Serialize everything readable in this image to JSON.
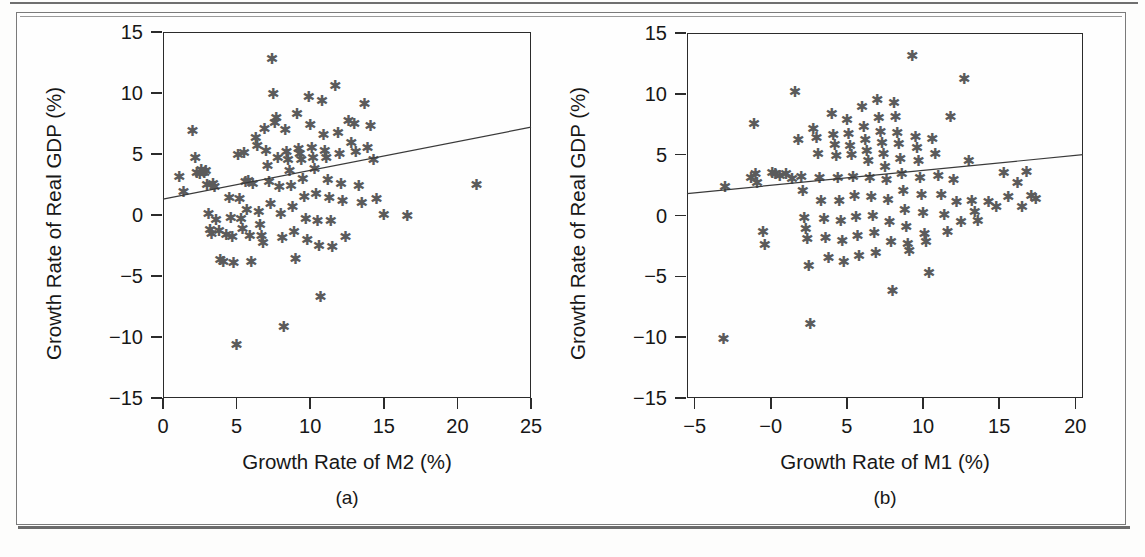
{
  "figure": {
    "panels": [
      {
        "id": "a",
        "caption": "(a)",
        "xlabel": "Growth Rate of M2 (%)",
        "ylabel": "Growth Rate of Real GDP (%)",
        "xticks": [
          "0",
          "5",
          "10",
          "15",
          "20",
          "25"
        ],
        "yticks": [
          "15",
          "10",
          "5",
          "0",
          "−5",
          "−10",
          "−15"
        ],
        "marker_glyph": "✱"
      },
      {
        "id": "b",
        "caption": "(b)",
        "xlabel": "Growth Rate of M1 (%)",
        "ylabel": "Growth Rate of Real GDP (%)",
        "xticks": [
          "−5",
          "−0",
          "5",
          "10",
          "15",
          "20"
        ],
        "yticks": [
          "15",
          "10",
          "5",
          "0",
          "−5",
          "−10",
          "−15"
        ],
        "marker_glyph": "✱"
      }
    ]
  },
  "chart_data": [
    {
      "type": "scatter",
      "id": "a",
      "title": "(a)",
      "xlabel": "Growth Rate of M2 (%)",
      "ylabel": "Growth Rate of Real GDP (%)",
      "xlim": [
        0,
        25
      ],
      "ylim": [
        -15,
        15
      ],
      "xticks": [
        0,
        5,
        10,
        15,
        20,
        25
      ],
      "yticks": [
        15,
        10,
        5,
        0,
        -5,
        -10,
        -15
      ],
      "grid": false,
      "legend": "none",
      "marker": "asterisk",
      "marker_color": "#5b5b5b",
      "trendline": {
        "x0": 0,
        "y0": 1.3,
        "x1": 25,
        "y1": 7.2,
        "color": "#3a3a3a"
      },
      "points": [
        [
          1.1,
          3.0
        ],
        [
          1.4,
          1.8
        ],
        [
          2.0,
          6.8
        ],
        [
          2.2,
          4.6
        ],
        [
          2.3,
          3.4
        ],
        [
          2.5,
          3.3
        ],
        [
          2.6,
          3.6
        ],
        [
          2.8,
          3.4
        ],
        [
          2.9,
          3.5
        ],
        [
          3.0,
          2.4
        ],
        [
          3.1,
          0.0
        ],
        [
          3.2,
          -1.3
        ],
        [
          3.3,
          -1.6
        ],
        [
          3.4,
          2.5
        ],
        [
          3.5,
          2.2
        ],
        [
          3.6,
          -0.5
        ],
        [
          3.8,
          -1.4
        ],
        [
          3.9,
          -3.8
        ],
        [
          4.1,
          -3.9
        ],
        [
          4.3,
          -1.7
        ],
        [
          4.5,
          1.3
        ],
        [
          4.6,
          -0.3
        ],
        [
          4.7,
          -1.9
        ],
        [
          4.8,
          -4.0
        ],
        [
          5.0,
          -10.7
        ],
        [
          5.1,
          4.8
        ],
        [
          5.2,
          1.2
        ],
        [
          5.3,
          -0.4
        ],
        [
          5.4,
          -1.2
        ],
        [
          5.5,
          5.0
        ],
        [
          5.6,
          2.6
        ],
        [
          5.7,
          0.3
        ],
        [
          5.8,
          2.7
        ],
        [
          5.9,
          -1.8
        ],
        [
          6.0,
          -3.9
        ],
        [
          6.1,
          2.5
        ],
        [
          6.3,
          6.2
        ],
        [
          6.4,
          5.6
        ],
        [
          6.5,
          0.2
        ],
        [
          6.6,
          -0.9
        ],
        [
          6.7,
          -1.8
        ],
        [
          6.8,
          -2.4
        ],
        [
          6.9,
          7.0
        ],
        [
          7.0,
          5.2
        ],
        [
          7.1,
          3.9
        ],
        [
          7.2,
          2.6
        ],
        [
          7.3,
          0.8
        ],
        [
          7.4,
          12.7
        ],
        [
          7.5,
          9.8
        ],
        [
          7.6,
          7.5
        ],
        [
          7.7,
          7.9
        ],
        [
          7.8,
          4.6
        ],
        [
          7.9,
          2.2
        ],
        [
          8.0,
          0.0
        ],
        [
          8.1,
          -2.0
        ],
        [
          8.2,
          -9.3
        ],
        [
          8.3,
          6.9
        ],
        [
          8.4,
          5.1
        ],
        [
          8.5,
          4.4
        ],
        [
          8.6,
          3.5
        ],
        [
          8.7,
          2.3
        ],
        [
          8.8,
          0.6
        ],
        [
          8.9,
          -1.5
        ],
        [
          9.0,
          -3.7
        ],
        [
          9.1,
          8.2
        ],
        [
          9.2,
          5.3
        ],
        [
          9.3,
          4.9
        ],
        [
          9.4,
          4.4
        ],
        [
          9.5,
          2.9
        ],
        [
          9.6,
          1.4
        ],
        [
          9.7,
          -0.4
        ],
        [
          9.8,
          -2.1
        ],
        [
          9.9,
          9.6
        ],
        [
          10.0,
          7.3
        ],
        [
          10.1,
          5.4
        ],
        [
          10.2,
          4.6
        ],
        [
          10.3,
          3.7
        ],
        [
          10.4,
          1.6
        ],
        [
          10.5,
          -0.6
        ],
        [
          10.6,
          -2.6
        ],
        [
          10.7,
          -6.8
        ],
        [
          10.8,
          9.3
        ],
        [
          10.9,
          6.5
        ],
        [
          11.0,
          5.2
        ],
        [
          11.1,
          4.6
        ],
        [
          11.2,
          2.8
        ],
        [
          11.3,
          1.3
        ],
        [
          11.4,
          -0.6
        ],
        [
          11.5,
          -2.7
        ],
        [
          11.7,
          10.5
        ],
        [
          11.9,
          6.6
        ],
        [
          12.0,
          4.9
        ],
        [
          12.1,
          2.5
        ],
        [
          12.2,
          1.1
        ],
        [
          12.4,
          -1.9
        ],
        [
          12.6,
          7.6
        ],
        [
          12.8,
          5.8
        ],
        [
          13.0,
          7.4
        ],
        [
          13.1,
          5.1
        ],
        [
          13.3,
          2.3
        ],
        [
          13.5,
          0.9
        ],
        [
          13.7,
          9.0
        ],
        [
          13.9,
          5.4
        ],
        [
          14.1,
          7.2
        ],
        [
          14.3,
          4.4
        ],
        [
          14.5,
          1.2
        ],
        [
          15.0,
          -0.1
        ],
        [
          16.6,
          -0.2
        ],
        [
          21.3,
          2.4
        ]
      ]
    },
    {
      "type": "scatter",
      "id": "b",
      "title": "(b)",
      "xlabel": "Growth Rate of M1 (%)",
      "ylabel": "Growth Rate of Real GDP (%)",
      "xlim": [
        -5.5,
        20.5
      ],
      "ylim": [
        -15,
        15
      ],
      "xticks": [
        -5,
        0,
        5,
        10,
        15,
        20
      ],
      "yticks": [
        15,
        10,
        5,
        0,
        -5,
        -10,
        -15
      ],
      "grid": false,
      "legend": "none",
      "marker": "asterisk",
      "marker_color": "#5b5b5b",
      "trendline": {
        "x0": -5.5,
        "y0": 1.8,
        "x1": 20.5,
        "y1": 5.0,
        "color": "#3a3a3a"
      },
      "points": [
        [
          -3.1,
          -10.2
        ],
        [
          -3.0,
          2.3
        ],
        [
          -1.3,
          3.0
        ],
        [
          -1.1,
          7.4
        ],
        [
          -1.0,
          3.3
        ],
        [
          -0.9,
          2.6
        ],
        [
          -0.5,
          -1.4
        ],
        [
          -0.4,
          -2.5
        ],
        [
          0.1,
          3.4
        ],
        [
          0.3,
          3.3
        ],
        [
          0.6,
          3.2
        ],
        [
          1.0,
          3.3
        ],
        [
          1.4,
          2.9
        ],
        [
          1.6,
          10.1
        ],
        [
          1.8,
          6.1
        ],
        [
          2.0,
          3.1
        ],
        [
          2.1,
          1.9
        ],
        [
          2.2,
          -0.3
        ],
        [
          2.3,
          -1.2
        ],
        [
          2.4,
          -2.0
        ],
        [
          2.5,
          -4.2
        ],
        [
          2.6,
          -9.0
        ],
        [
          2.8,
          7.0
        ],
        [
          3.0,
          6.3
        ],
        [
          3.1,
          5.0
        ],
        [
          3.2,
          3.0
        ],
        [
          3.3,
          1.1
        ],
        [
          3.5,
          -0.4
        ],
        [
          3.6,
          -1.9
        ],
        [
          3.8,
          -3.6
        ],
        [
          4.0,
          8.3
        ],
        [
          4.1,
          6.5
        ],
        [
          4.2,
          5.7
        ],
        [
          4.3,
          4.8
        ],
        [
          4.4,
          3.0
        ],
        [
          4.5,
          1.1
        ],
        [
          4.6,
          -0.5
        ],
        [
          4.7,
          -2.2
        ],
        [
          4.8,
          -3.9
        ],
        [
          5.0,
          7.8
        ],
        [
          5.1,
          6.6
        ],
        [
          5.2,
          5.6
        ],
        [
          5.3,
          4.9
        ],
        [
          5.4,
          3.1
        ],
        [
          5.5,
          1.5
        ],
        [
          5.6,
          -0.2
        ],
        [
          5.7,
          -1.8
        ],
        [
          5.8,
          -3.4
        ],
        [
          6.0,
          8.8
        ],
        [
          6.1,
          7.2
        ],
        [
          6.2,
          6.1
        ],
        [
          6.3,
          5.2
        ],
        [
          6.4,
          4.4
        ],
        [
          6.5,
          3.0
        ],
        [
          6.6,
          1.4
        ],
        [
          6.7,
          -0.1
        ],
        [
          6.8,
          -1.5
        ],
        [
          6.9,
          -3.2
        ],
        [
          7.0,
          9.4
        ],
        [
          7.1,
          7.9
        ],
        [
          7.2,
          6.8
        ],
        [
          7.3,
          5.9
        ],
        [
          7.4,
          5.0
        ],
        [
          7.5,
          3.9
        ],
        [
          7.6,
          2.8
        ],
        [
          7.7,
          1.2
        ],
        [
          7.8,
          -0.6
        ],
        [
          7.9,
          -2.3
        ],
        [
          8.0,
          -6.3
        ],
        [
          8.1,
          9.2
        ],
        [
          8.2,
          8.0
        ],
        [
          8.3,
          6.7
        ],
        [
          8.4,
          5.8
        ],
        [
          8.5,
          4.6
        ],
        [
          8.6,
          3.3
        ],
        [
          8.7,
          1.9
        ],
        [
          8.8,
          0.4
        ],
        [
          8.9,
          -1.0
        ],
        [
          9.0,
          -2.4
        ],
        [
          9.1,
          -3.0
        ],
        [
          9.3,
          13.0
        ],
        [
          9.5,
          6.4
        ],
        [
          9.6,
          5.5
        ],
        [
          9.7,
          4.4
        ],
        [
          9.8,
          3.0
        ],
        [
          9.9,
          1.6
        ],
        [
          10.0,
          0.1
        ],
        [
          10.1,
          -1.6
        ],
        [
          10.2,
          -2.3
        ],
        [
          10.4,
          -4.8
        ],
        [
          10.6,
          6.2
        ],
        [
          10.8,
          5.0
        ],
        [
          11.0,
          3.2
        ],
        [
          11.2,
          1.6
        ],
        [
          11.4,
          0.0
        ],
        [
          11.6,
          -1.4
        ],
        [
          11.8,
          8.0
        ],
        [
          12.0,
          2.8
        ],
        [
          12.2,
          1.0
        ],
        [
          12.5,
          -0.6
        ],
        [
          12.7,
          11.1
        ],
        [
          13.0,
          4.4
        ],
        [
          13.2,
          1.1
        ],
        [
          13.4,
          0.2
        ],
        [
          13.6,
          -0.5
        ],
        [
          14.3,
          1.0
        ],
        [
          14.8,
          0.6
        ],
        [
          15.3,
          3.4
        ],
        [
          15.6,
          1.4
        ],
        [
          16.2,
          2.6
        ],
        [
          16.5,
          0.6
        ],
        [
          16.8,
          3.5
        ],
        [
          17.1,
          1.5
        ],
        [
          17.4,
          1.3
        ]
      ]
    }
  ]
}
